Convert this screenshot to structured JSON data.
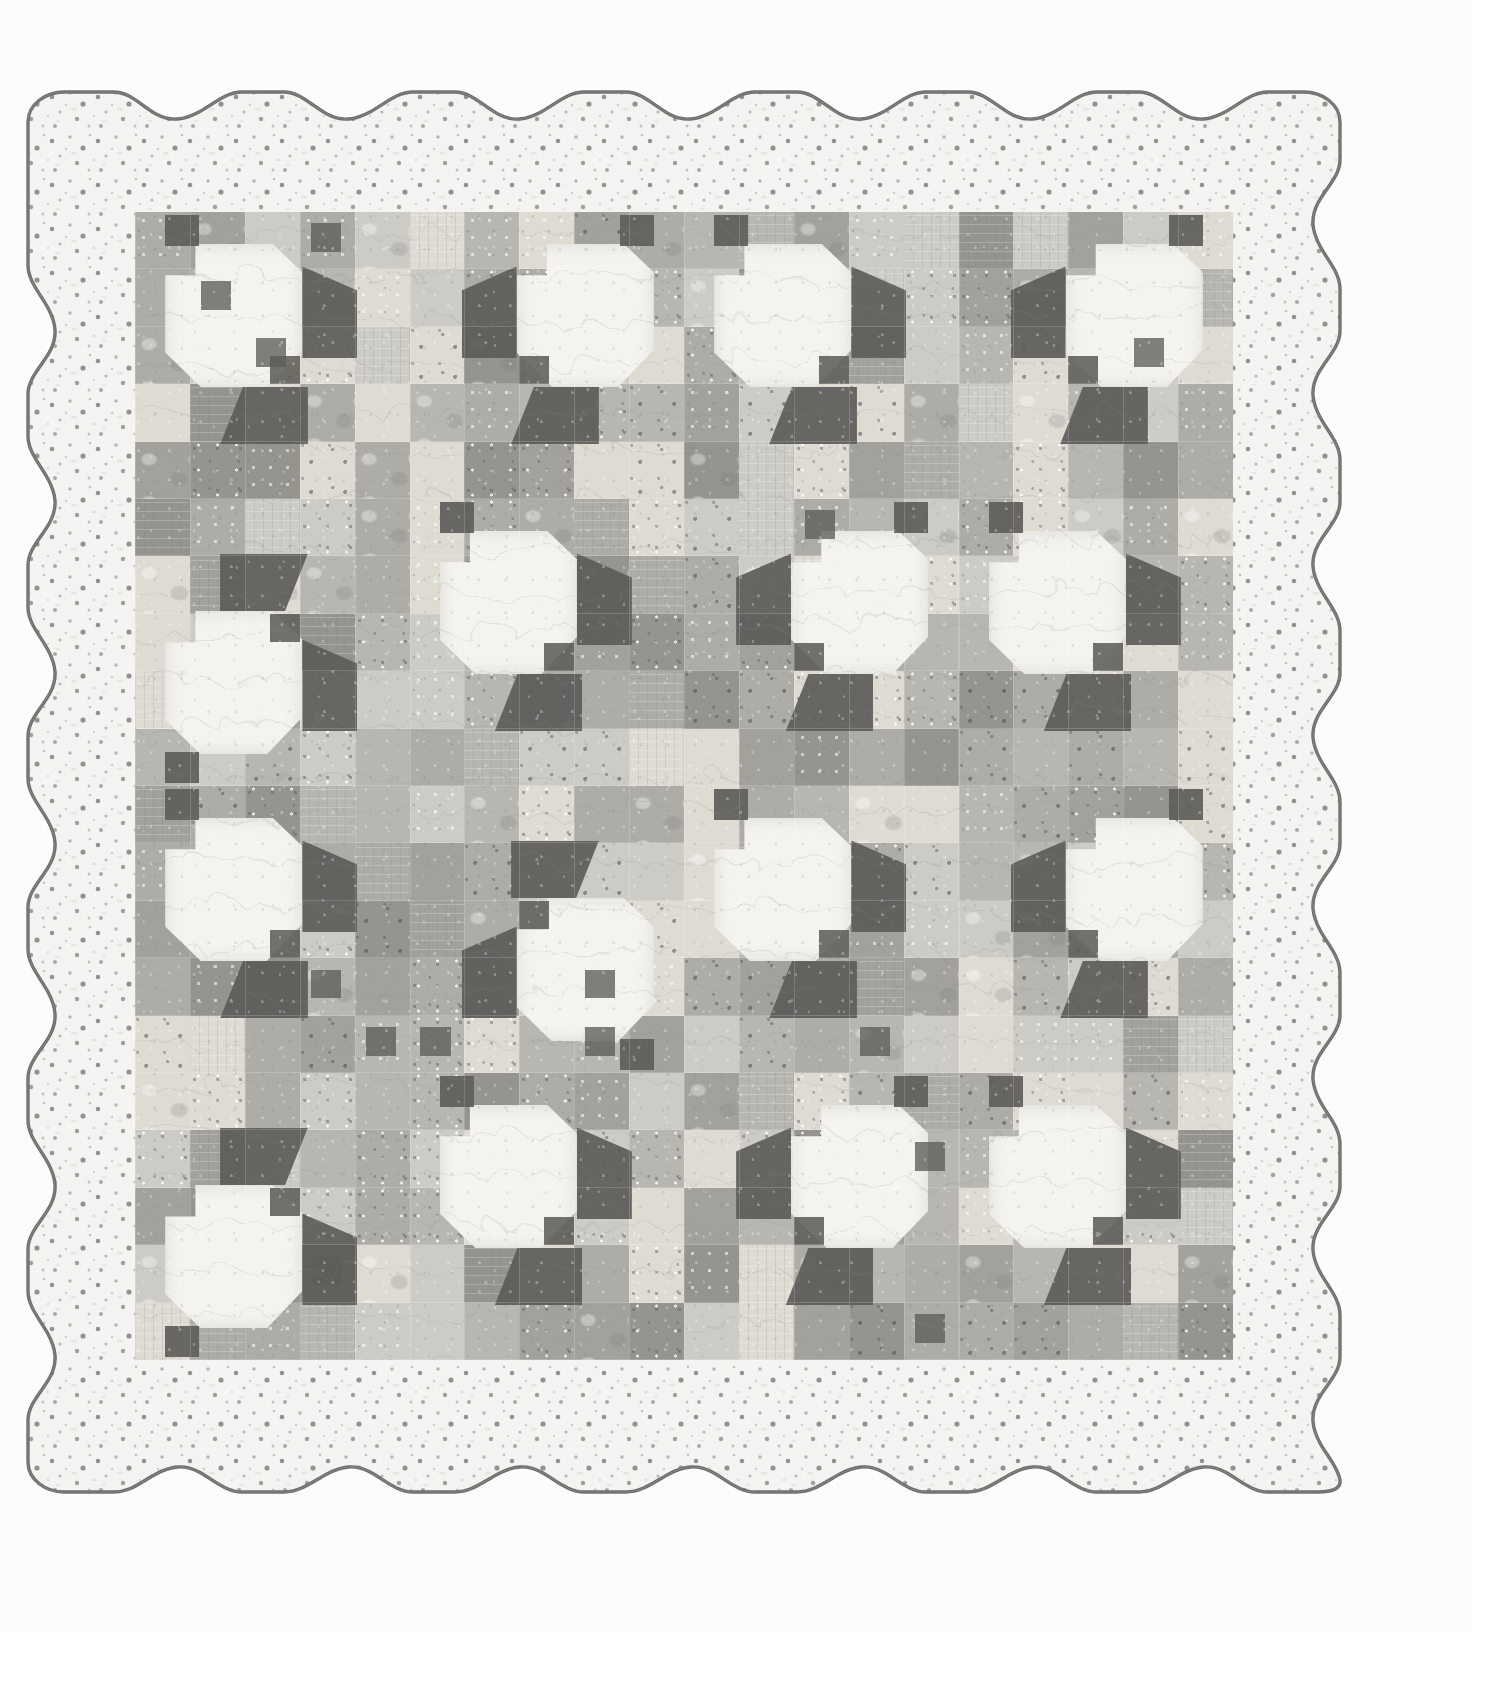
{
  "image": {
    "subject": "patchwork-quilt-photograph",
    "width": 1507,
    "height": 1692,
    "background_color": "#ffffff",
    "caption": ""
  },
  "quilt": {
    "name": "scalloped-edge-tulip-patchwork-quilt",
    "outline": {
      "style": "scalloped",
      "binding_color": "#6e6e6e",
      "binding_width_px": 3,
      "scallop_wavelength_px": 171,
      "scallop_depth_px": 30,
      "left": 28,
      "top": 92,
      "right": 1340,
      "bottom": 1492
    },
    "border": {
      "name": "outer-border-speckled-white",
      "fabric": "white-with-dark-speckles",
      "base_color": "#f6f5f2",
      "speck_color": "#8a8a86",
      "width_px": 107
    },
    "center_field": {
      "name": "patchwork-center",
      "left": 135,
      "top": 212,
      "width": 1098,
      "height": 1148,
      "base_color": "#b9b7b2",
      "patch_cell_width_px": 54.9,
      "patch_cell_height_px": 57.4,
      "grid_columns": 20,
      "grid_rows": 20
    },
    "palette": {
      "light_speckle": "#f4f3ef",
      "cream": "#dedbd3",
      "light_gray": "#cdcbc5",
      "mid_gray": "#b8b6b0",
      "mid_gray_2": "#aeaca6",
      "darker_gray": "#a3a19b",
      "deep_gray": "#96948e",
      "charcoal": "#5e5d59",
      "binding": "#6e6e6e"
    },
    "blocks": {
      "motif": "tulip-flower-block",
      "block_size_px": 275,
      "blocks_across": 4,
      "blocks_down": 4,
      "description": "Each block shows a light speckled flower head with charcoal leaf/stem triangles, set on a scrappy gray checkerboard background."
    }
  },
  "chart_data": {
    "type": "table",
    "columns": [
      "row",
      "col",
      "tone"
    ],
    "note": "Scrappy gray patchwork grid, 20 x 20 cells"
  }
}
